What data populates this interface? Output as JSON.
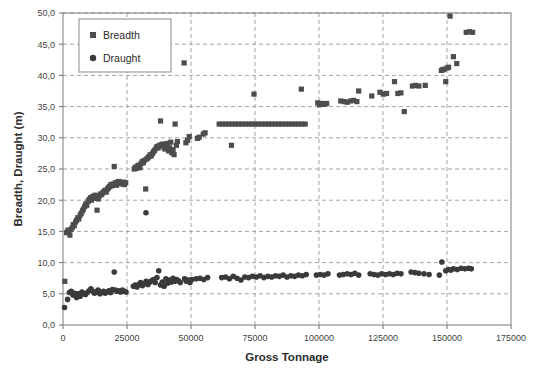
{
  "chart_data": {
    "type": "scatter",
    "title": "",
    "xlabel": "Gross Tonnage",
    "ylabel": "Breadth, Draught (m)",
    "xlim": [
      0,
      175000
    ],
    "ylim": [
      0,
      50
    ],
    "xticks": [
      0,
      25000,
      50000,
      75000,
      100000,
      125000,
      150000,
      175000
    ],
    "xtick_labels": [
      "0",
      "25000",
      "50000",
      "75000",
      "100000",
      "125000",
      "150000",
      "175000"
    ],
    "yticks": [
      0,
      5,
      10,
      15,
      20,
      25,
      30,
      35,
      40,
      45,
      50
    ],
    "ytick_labels": [
      "0,0",
      "5,0",
      "10,0",
      "15,0",
      "20,0",
      "25,0",
      "30,0",
      "35,0",
      "40,0",
      "45,0",
      "50,0"
    ],
    "grid": true,
    "grid_style": "dashed",
    "grid_color": "#9a9a9a",
    "legend_position": "upper-left",
    "marker_color": "#4d4d4d",
    "series": [
      {
        "name": "Breadth",
        "marker": "square",
        "color": "#4d4d4d",
        "points": [
          [
            700,
            7.0
          ],
          [
            1400,
            14.8
          ],
          [
            1900,
            15.2
          ],
          [
            2300,
            15.0
          ],
          [
            2700,
            14.4
          ],
          [
            3100,
            15.3
          ],
          [
            3600,
            15.6
          ],
          [
            4000,
            16.1
          ],
          [
            4400,
            15.9
          ],
          [
            4900,
            16.5
          ],
          [
            5300,
            16.8
          ],
          [
            5800,
            17.2
          ],
          [
            6200,
            17.0
          ],
          [
            6700,
            17.6
          ],
          [
            7100,
            17.9
          ],
          [
            7600,
            18.3
          ],
          [
            8000,
            18.6
          ],
          [
            8500,
            19.0
          ],
          [
            8900,
            19.4
          ],
          [
            9300,
            19.2
          ],
          [
            9800,
            19.8
          ],
          [
            10200,
            20.1
          ],
          [
            10700,
            20.4
          ],
          [
            11100,
            20.0
          ],
          [
            11600,
            20.6
          ],
          [
            12000,
            20.3
          ],
          [
            12500,
            20.8
          ],
          [
            12900,
            20.5
          ],
          [
            13300,
            18.4
          ],
          [
            13800,
            20.2
          ],
          [
            14200,
            20.7
          ],
          [
            14700,
            21.0
          ],
          [
            15100,
            20.9
          ],
          [
            15600,
            21.2
          ],
          [
            16000,
            21.4
          ],
          [
            16500,
            21.6
          ],
          [
            16900,
            21.3
          ],
          [
            17400,
            21.8
          ],
          [
            17800,
            22.0
          ],
          [
            18200,
            22.2
          ],
          [
            18700,
            22.5
          ],
          [
            19100,
            22.3
          ],
          [
            19600,
            22.6
          ],
          [
            20000,
            25.4
          ],
          [
            20500,
            22.8
          ],
          [
            20900,
            22.4
          ],
          [
            21400,
            22.9
          ],
          [
            21800,
            23.0
          ],
          [
            22300,
            22.7
          ],
          [
            22700,
            22.8
          ],
          [
            23100,
            22.6
          ],
          [
            23600,
            22.9
          ],
          [
            24000,
            22.5
          ],
          [
            24500,
            22.8
          ],
          [
            27800,
            25.0
          ],
          [
            28300,
            25.3
          ],
          [
            28700,
            25.1
          ],
          [
            29200,
            25.5
          ],
          [
            29600,
            25.6
          ],
          [
            30100,
            25.2
          ],
          [
            30500,
            25.9
          ],
          [
            31000,
            26.2
          ],
          [
            31400,
            26.0
          ],
          [
            31800,
            26.4
          ],
          [
            32300,
            21.8
          ],
          [
            32700,
            26.6
          ],
          [
            33200,
            26.8
          ],
          [
            33600,
            27.0
          ],
          [
            34100,
            27.3
          ],
          [
            34500,
            27.1
          ],
          [
            35000,
            27.5
          ],
          [
            35400,
            27.8
          ],
          [
            35800,
            28.0
          ],
          [
            36300,
            28.3
          ],
          [
            36700,
            28.6
          ],
          [
            37200,
            28.4
          ],
          [
            37600,
            28.8
          ],
          [
            38100,
            32.7
          ],
          [
            38500,
            28.9
          ],
          [
            39000,
            29.0
          ],
          [
            39400,
            28.5
          ],
          [
            39800,
            28.2
          ],
          [
            40300,
            28.7
          ],
          [
            40700,
            29.1
          ],
          [
            41200,
            27.9
          ],
          [
            41600,
            28.4
          ],
          [
            42100,
            29.3
          ],
          [
            42500,
            27.6
          ],
          [
            43000,
            28.1
          ],
          [
            43400,
            27.3
          ],
          [
            43800,
            32.2
          ],
          [
            44300,
            28.8
          ],
          [
            44700,
            29.4
          ],
          [
            47300,
            42.0
          ],
          [
            48000,
            29.2
          ],
          [
            48600,
            29.6
          ],
          [
            49300,
            30.2
          ],
          [
            52500,
            29.9
          ],
          [
            53200,
            30.1
          ],
          [
            54800,
            30.6
          ],
          [
            55500,
            30.8
          ],
          [
            61000,
            32.2
          ],
          [
            62400,
            32.2
          ],
          [
            63600,
            32.2
          ],
          [
            64800,
            32.2
          ],
          [
            65800,
            28.8
          ],
          [
            66200,
            32.2
          ],
          [
            67400,
            32.2
          ],
          [
            68600,
            32.2
          ],
          [
            69900,
            32.2
          ],
          [
            71200,
            32.2
          ],
          [
            72500,
            32.2
          ],
          [
            73800,
            32.2
          ],
          [
            74600,
            37.0
          ],
          [
            75100,
            32.2
          ],
          [
            76400,
            32.2
          ],
          [
            77700,
            32.2
          ],
          [
            79000,
            32.2
          ],
          [
            80300,
            32.2
          ],
          [
            81600,
            32.2
          ],
          [
            82900,
            32.2
          ],
          [
            84200,
            32.2
          ],
          [
            85500,
            32.2
          ],
          [
            86800,
            32.2
          ],
          [
            88100,
            32.2
          ],
          [
            89400,
            32.2
          ],
          [
            90700,
            32.2
          ],
          [
            92000,
            32.2
          ],
          [
            93100,
            37.8
          ],
          [
            93300,
            32.2
          ],
          [
            94600,
            32.2
          ],
          [
            99500,
            35.6
          ],
          [
            100200,
            35.3
          ],
          [
            100900,
            35.5
          ],
          [
            101600,
            35.4
          ],
          [
            102300,
            35.4
          ],
          [
            103000,
            35.5
          ],
          [
            108500,
            35.9
          ],
          [
            109800,
            35.8
          ],
          [
            111000,
            35.7
          ],
          [
            112300,
            35.9
          ],
          [
            113500,
            36.0
          ],
          [
            114800,
            35.8
          ],
          [
            115500,
            37.5
          ],
          [
            120600,
            36.7
          ],
          [
            123800,
            37.3
          ],
          [
            125100,
            37.0
          ],
          [
            126400,
            37.1
          ],
          [
            129500,
            39.0
          ],
          [
            130800,
            37.1
          ],
          [
            132000,
            37.2
          ],
          [
            133300,
            34.2
          ],
          [
            136500,
            38.3
          ],
          [
            137800,
            38.4
          ],
          [
            139000,
            38.3
          ],
          [
            141500,
            38.4
          ],
          [
            147800,
            40.8
          ],
          [
            148300,
            40.9
          ],
          [
            148900,
            41.0
          ],
          [
            149500,
            39.0
          ],
          [
            150100,
            41.2
          ],
          [
            150600,
            41.3
          ],
          [
            151200,
            49.5
          ],
          [
            152500,
            43.0
          ],
          [
            153800,
            41.9
          ],
          [
            157500,
            46.9
          ],
          [
            158800,
            47.0
          ],
          [
            160000,
            46.9
          ]
        ]
      },
      {
        "name": "Draught",
        "marker": "circle",
        "color": "#3a3a3a",
        "points": [
          [
            600,
            2.8
          ],
          [
            1800,
            4.1
          ],
          [
            2500,
            5.2
          ],
          [
            3200,
            5.4
          ],
          [
            3900,
            4.8
          ],
          [
            4600,
            5.1
          ],
          [
            5300,
            4.4
          ],
          [
            6000,
            5.0
          ],
          [
            6700,
            4.6
          ],
          [
            7400,
            5.3
          ],
          [
            8100,
            5.0
          ],
          [
            8800,
            4.9
          ],
          [
            9500,
            5.2
          ],
          [
            10200,
            5.5
          ],
          [
            10900,
            5.8
          ],
          [
            11600,
            5.4
          ],
          [
            12300,
            5.1
          ],
          [
            13000,
            5.3
          ],
          [
            13700,
            5.6
          ],
          [
            14400,
            5.0
          ],
          [
            15100,
            5.2
          ],
          [
            15800,
            5.4
          ],
          [
            16500,
            5.1
          ],
          [
            17200,
            5.3
          ],
          [
            17900,
            5.5
          ],
          [
            18600,
            5.2
          ],
          [
            19300,
            5.7
          ],
          [
            20000,
            8.5
          ],
          [
            20400,
            5.6
          ],
          [
            21100,
            5.4
          ],
          [
            21800,
            5.5
          ],
          [
            22500,
            5.3
          ],
          [
            23200,
            5.6
          ],
          [
            23900,
            5.4
          ],
          [
            24600,
            5.3
          ],
          [
            27500,
            6.2
          ],
          [
            28200,
            6.4
          ],
          [
            28900,
            6.1
          ],
          [
            29600,
            6.5
          ],
          [
            30300,
            6.8
          ],
          [
            31000,
            6.3
          ],
          [
            31700,
            6.6
          ],
          [
            32400,
            18.0
          ],
          [
            32500,
            7.0
          ],
          [
            33200,
            6.5
          ],
          [
            33900,
            6.9
          ],
          [
            34600,
            7.1
          ],
          [
            35300,
            7.3
          ],
          [
            36000,
            6.8
          ],
          [
            36700,
            7.6
          ],
          [
            37400,
            8.7
          ],
          [
            38100,
            6.4
          ],
          [
            38800,
            6.9
          ],
          [
            39500,
            6.2
          ],
          [
            40200,
            7.4
          ],
          [
            40900,
            6.7
          ],
          [
            41600,
            7.2
          ],
          [
            42300,
            6.9
          ],
          [
            43000,
            7.5
          ],
          [
            43700,
            7.0
          ],
          [
            44400,
            7.3
          ],
          [
            45100,
            7.1
          ],
          [
            45800,
            6.8
          ],
          [
            47500,
            7.4
          ],
          [
            48200,
            7.0
          ],
          [
            48900,
            7.2
          ],
          [
            49600,
            6.8
          ],
          [
            50300,
            7.3
          ],
          [
            52000,
            7.4
          ],
          [
            53500,
            7.5
          ],
          [
            55000,
            7.3
          ],
          [
            56500,
            7.6
          ],
          [
            62000,
            7.6
          ],
          [
            63500,
            7.7
          ],
          [
            65000,
            7.4
          ],
          [
            66500,
            7.8
          ],
          [
            68000,
            7.5
          ],
          [
            69500,
            7.2
          ],
          [
            71000,
            7.7
          ],
          [
            72500,
            7.6
          ],
          [
            74000,
            7.8
          ],
          [
            75500,
            7.7
          ],
          [
            77000,
            7.9
          ],
          [
            78500,
            7.6
          ],
          [
            80000,
            7.8
          ],
          [
            81500,
            7.7
          ],
          [
            83000,
            7.9
          ],
          [
            84500,
            7.8
          ],
          [
            86000,
            8.0
          ],
          [
            87500,
            7.7
          ],
          [
            89000,
            7.9
          ],
          [
            90500,
            7.8
          ],
          [
            92000,
            8.0
          ],
          [
            93500,
            7.9
          ],
          [
            95000,
            8.1
          ],
          [
            99000,
            8.0
          ],
          [
            100500,
            8.1
          ],
          [
            102000,
            8.0
          ],
          [
            103500,
            8.2
          ],
          [
            108000,
            8.0
          ],
          [
            109500,
            8.1
          ],
          [
            111000,
            8.2
          ],
          [
            112500,
            8.1
          ],
          [
            114000,
            8.3
          ],
          [
            115500,
            8.0
          ],
          [
            120000,
            8.2
          ],
          [
            121500,
            8.1
          ],
          [
            123000,
            8.0
          ],
          [
            124500,
            8.2
          ],
          [
            126000,
            8.1
          ],
          [
            127500,
            8.2
          ],
          [
            129000,
            8.1
          ],
          [
            130500,
            8.3
          ],
          [
            132000,
            8.2
          ],
          [
            136000,
            8.5
          ],
          [
            137500,
            8.4
          ],
          [
            139000,
            8.3
          ],
          [
            141000,
            8.2
          ],
          [
            143000,
            8.1
          ],
          [
            147000,
            8.0
          ],
          [
            148000,
            10.1
          ],
          [
            149500,
            8.7
          ],
          [
            150500,
            8.9
          ],
          [
            151500,
            8.8
          ],
          [
            152500,
            9.0
          ],
          [
            154000,
            8.9
          ],
          [
            155500,
            9.1
          ],
          [
            157000,
            9.0
          ],
          [
            158500,
            9.1
          ],
          [
            159500,
            9.0
          ]
        ]
      }
    ]
  },
  "legend": {
    "items": [
      {
        "label": "Breadth",
        "marker": "square"
      },
      {
        "label": "Draught",
        "marker": "circle"
      }
    ]
  }
}
